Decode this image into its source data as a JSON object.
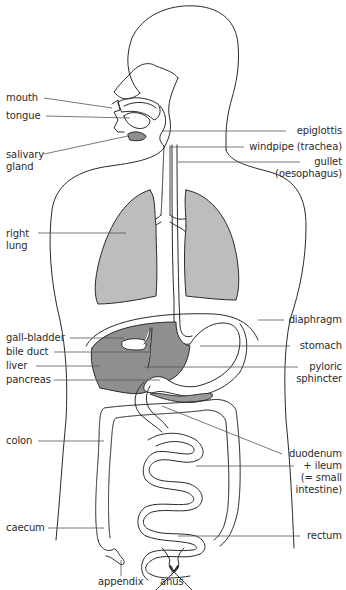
{
  "colors": {
    "outline": "#2a2a2a",
    "leader": "#555555",
    "lung_fill": "#bdbdbd",
    "liver_fill": "#8f8f8f",
    "pancreas_fill": "#9a9a9a",
    "background": "#ffffff"
  },
  "labels": {
    "left": [
      {
        "id": "mouth",
        "text": "mouth"
      },
      {
        "id": "tongue",
        "text": "tongue"
      },
      {
        "id": "salivary_gland",
        "text": "salivary",
        "text2": "gland"
      },
      {
        "id": "right_lung",
        "text": "right",
        "text2": "lung"
      },
      {
        "id": "gall_bladder",
        "text": "gall-bladder"
      },
      {
        "id": "bile_duct",
        "text": "bile duct"
      },
      {
        "id": "liver",
        "text": "liver"
      },
      {
        "id": "pancreas",
        "text": "pancreas"
      },
      {
        "id": "colon",
        "text": "colon"
      },
      {
        "id": "caecum",
        "text": "caecum"
      }
    ],
    "right": [
      {
        "id": "epiglottis",
        "text": "epiglottis"
      },
      {
        "id": "windpipe",
        "text": "windpipe (trachea)"
      },
      {
        "id": "gullet",
        "text": "gullet",
        "text2": "(oesophagus)"
      },
      {
        "id": "diaphragm",
        "text": "diaphragm"
      },
      {
        "id": "stomach",
        "text": "stomach"
      },
      {
        "id": "pyloric_sphincter",
        "text": "pyloric",
        "text2": "sphincter"
      },
      {
        "id": "duodenum_ileum",
        "text": "duodenum",
        "text2": "+ ileum",
        "text3": "(= small",
        "text4": "intestine)"
      },
      {
        "id": "rectum",
        "text": "rectum"
      }
    ],
    "bottom": [
      {
        "id": "appendix",
        "text": "appendix"
      },
      {
        "id": "anus",
        "text": "anus"
      }
    ]
  }
}
